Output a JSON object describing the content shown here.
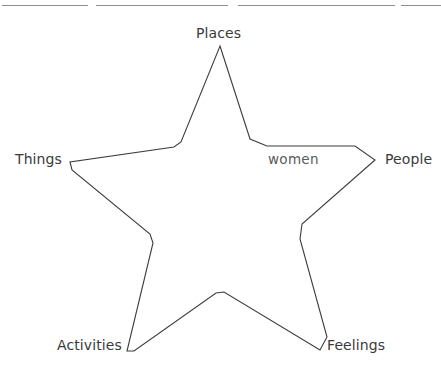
{
  "page": {
    "background_color": "#ffffff",
    "width": 441,
    "height": 368
  },
  "top_rules": [
    {
      "name": "rule-left",
      "x": 2,
      "y": 5,
      "width": 86,
      "color": "#8d8d8d"
    },
    {
      "name": "rule-center",
      "x": 96,
      "y": 5,
      "width": 132,
      "color": "#8d8d8d"
    },
    {
      "name": "rule-right",
      "x": 238,
      "y": 5,
      "width": 157,
      "color": "#8d8d8d"
    },
    {
      "name": "rule-far-right",
      "x": 401,
      "y": 5,
      "width": 40,
      "color": "#8d8d8d"
    }
  ],
  "diagram": {
    "type": "five-point-star",
    "stroke_color": "#3c3c3c",
    "stroke_width": 1.1,
    "fill": "none",
    "points": "220,46 250,139 267,146 355,146 375,160 302,224 300,239 327,337 320,350 224,292 216,293 134,351 127,351 153,243 150,234 72,170 70,162 174,147 181,142",
    "outer_vertices": [
      {
        "name": "top",
        "x": 220,
        "y": 46
      },
      {
        "name": "right",
        "x": 375,
        "y": 160
      },
      {
        "name": "bottom-right",
        "x": 320,
        "y": 350
      },
      {
        "name": "bottom-left",
        "x": 127,
        "y": 351
      },
      {
        "name": "left",
        "x": 70,
        "y": 162
      }
    ],
    "inner_vertices": [
      {
        "name": "upper-right",
        "x": 267,
        "y": 146
      },
      {
        "name": "lower-right",
        "x": 300,
        "y": 239
      },
      {
        "name": "bottom",
        "x": 221,
        "y": 296
      },
      {
        "name": "lower-left",
        "x": 137,
        "y": 238
      },
      {
        "name": "upper-left",
        "x": 174,
        "y": 147
      }
    ]
  },
  "labels": {
    "places": {
      "text": "Places",
      "x": 196,
      "y": 25
    },
    "things": {
      "text": "Things",
      "x": 15,
      "y": 151
    },
    "people": {
      "text": "People",
      "x": 385,
      "y": 151
    },
    "activities": {
      "text": "Activities",
      "x": 57,
      "y": 337
    },
    "feelings": {
      "text": "Feelings",
      "x": 327,
      "y": 337
    },
    "annotation": {
      "text": "women",
      "x": 268,
      "y": 151
    }
  }
}
